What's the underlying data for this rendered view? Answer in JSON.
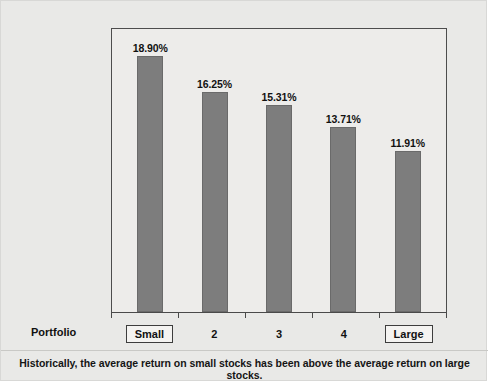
{
  "figure": {
    "caption": "Historically, the average return on small stocks has been above the average return on large stocks.",
    "axis_row_label": "Portfolio",
    "bar_color": "#7d7d7d",
    "plot_background": "#edecea",
    "card_background": "#e9e9e7",
    "frame_color": "#4d4d4d"
  },
  "chart_data": {
    "type": "bar",
    "title": "",
    "xlabel": "Portfolio",
    "ylabel": "",
    "categories": [
      "Small",
      "2",
      "3",
      "4",
      "Large"
    ],
    "values": [
      18.9,
      16.25,
      15.31,
      13.71,
      11.91
    ],
    "data_labels": [
      "18.90%",
      "16.25%",
      "15.31%",
      "13.71%",
      "11.91%"
    ],
    "ylim": [
      0,
      21.0
    ],
    "grid": false,
    "legend": "none",
    "boxed_categories": [
      "Small",
      "Large"
    ],
    "annotations": [
      "Historically, the average return on small stocks has been above the average return on large stocks."
    ]
  }
}
